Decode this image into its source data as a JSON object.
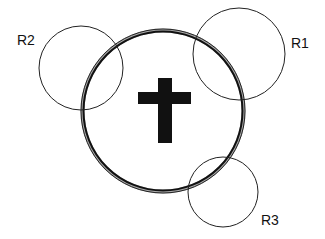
{
  "diagram": {
    "main_circle": {
      "cx": 163,
      "cy": 111,
      "r": 80,
      "stroke": "#111111",
      "style": "double-ring"
    },
    "symbol": {
      "name": "cross",
      "color": "#111111"
    },
    "regions": [
      {
        "id": "R1",
        "label": "R1",
        "cx": 239,
        "cy": 54,
        "r": 46
      },
      {
        "id": "R2",
        "label": "R2",
        "cx": 81,
        "cy": 68,
        "r": 42
      },
      {
        "id": "R3",
        "label": "R3",
        "cx": 223,
        "cy": 192,
        "r": 35
      }
    ]
  }
}
